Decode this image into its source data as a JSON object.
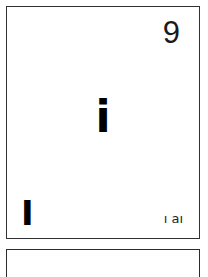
{
  "page": {
    "background_color": "#ffffff",
    "ink_color": "#1a1a1a",
    "border_color": "#2b2b2b"
  },
  "element_cell": {
    "atomic_number": "9",
    "symbol": "i",
    "left_mark": "I",
    "bottom_caption": "ı aı"
  },
  "next_cell": {
    "note": ""
  }
}
